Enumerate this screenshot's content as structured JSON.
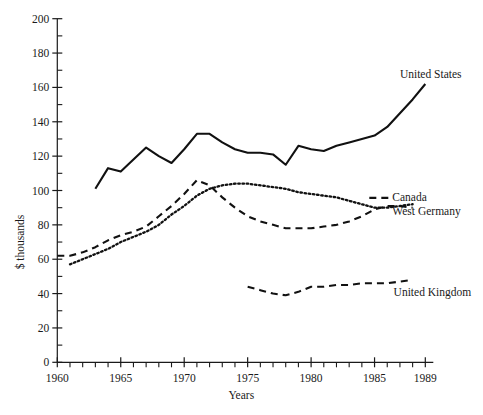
{
  "chart_data": {
    "type": "line",
    "title": "",
    "xlabel": "Years",
    "ylabel": "$ thousands",
    "xlim": [
      1960,
      1989
    ],
    "ylim": [
      0,
      200
    ],
    "ytick_step": 20,
    "yticks": [
      0,
      20,
      40,
      60,
      80,
      100,
      120,
      140,
      160,
      180,
      200
    ],
    "ytick_labels": [
      "0",
      "20",
      "40",
      "60",
      "80",
      "100",
      "120",
      "140",
      "160",
      "180",
      "200"
    ],
    "xticks": [
      1960,
      1965,
      1970,
      1975,
      1980,
      1985,
      1989
    ],
    "xtick_labels": [
      "1960",
      "1965",
      "1970",
      "1975",
      "1980",
      "1985",
      "1989"
    ],
    "x_minor_tick_step": 1,
    "grid": false,
    "legend_position": "inline-right-of-series-end",
    "series": [
      {
        "name": "United States",
        "style": "solid",
        "label": "United States",
        "label_x": 1987.0,
        "label_y": 168,
        "x": [
          1963,
          1964,
          1965,
          1966,
          1967,
          1968,
          1969,
          1970,
          1971,
          1972,
          1973,
          1974,
          1975,
          1976,
          1977,
          1978,
          1979,
          1980,
          1981,
          1982,
          1983,
          1984,
          1985,
          1986,
          1987,
          1988,
          1989
        ],
        "values": [
          101,
          113,
          111,
          118,
          125,
          120,
          116,
          124,
          133,
          133,
          128,
          124,
          122,
          122,
          121,
          115,
          126,
          124,
          123,
          126,
          128,
          130,
          132,
          137,
          145,
          153,
          162
        ]
      },
      {
        "name": "West Germany",
        "style": "dashed",
        "label": "West Germany",
        "label_x": 1986.4,
        "label_y": 88,
        "x": [
          1960,
          1961,
          1962,
          1963,
          1964,
          1965,
          1966,
          1967,
          1968,
          1969,
          1970,
          1971,
          1972,
          1973,
          1974,
          1975,
          1976,
          1977,
          1978,
          1979,
          1980,
          1981,
          1982,
          1983,
          1984,
          1985,
          1986,
          1987,
          1988
        ],
        "values": [
          62,
          62,
          64,
          67,
          71,
          74,
          76,
          79,
          85,
          91,
          98,
          106,
          103,
          96,
          90,
          85,
          82,
          80,
          78,
          78,
          78,
          79,
          80,
          82,
          85,
          89,
          91,
          91,
          90
        ]
      },
      {
        "name": "Canada",
        "style": "dotted",
        "label": "Canada",
        "label_x": 1986.4,
        "label_y": 96,
        "x": [
          1961,
          1962,
          1963,
          1964,
          1965,
          1966,
          1967,
          1968,
          1969,
          1970,
          1971,
          1972,
          1973,
          1974,
          1975,
          1976,
          1977,
          1978,
          1979,
          1980,
          1981,
          1982,
          1983,
          1984,
          1985,
          1986,
          1987,
          1988
        ],
        "values": [
          57,
          60,
          63,
          66,
          70,
          73,
          76,
          80,
          86,
          91,
          97,
          101,
          103,
          104,
          104,
          103,
          102,
          101,
          99,
          98,
          97,
          96,
          94,
          92,
          90,
          90,
          91,
          92
        ]
      },
      {
        "name": "United Kingdom",
        "style": "dashed",
        "label": "United Kingdom",
        "label_x": 1986.5,
        "label_y": 41,
        "x": [
          1975,
          1976,
          1977,
          1978,
          1979,
          1980,
          1981,
          1982,
          1983,
          1984,
          1985,
          1986,
          1987,
          1988
        ],
        "values": [
          44,
          42,
          40,
          39,
          41,
          44,
          44,
          45,
          45,
          46,
          46,
          46,
          47,
          48
        ]
      }
    ]
  }
}
